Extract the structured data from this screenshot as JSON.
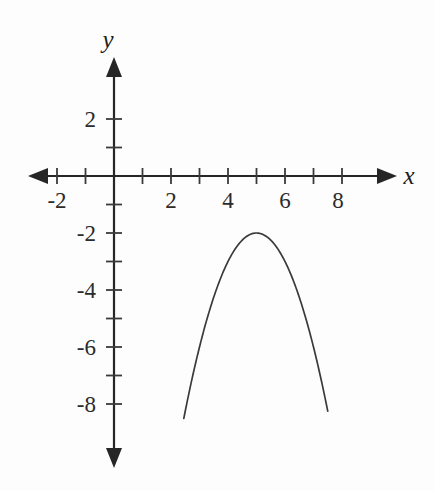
{
  "figure": {
    "background_color": "#fdfdfd",
    "ink_color": "#2b2b2b",
    "axis_label_x": "x",
    "axis_label_y": "y"
  },
  "chart_data": {
    "type": "line",
    "title": "",
    "xlabel": "x",
    "ylabel": "y",
    "grid": false,
    "legend": "none",
    "xlim": [
      -3,
      9.9
    ],
    "ylim": [
      -10.2,
      3.6
    ],
    "x_tick_labels": [
      "-2",
      "2",
      "4",
      "6",
      "8"
    ],
    "x_tick_values": [
      -2,
      2,
      4,
      6,
      8
    ],
    "x_minor_ticks": [
      -2,
      -1,
      1,
      2,
      3,
      4,
      5,
      6,
      7,
      8
    ],
    "y_tick_labels": [
      "2",
      "-2",
      "-4",
      "-6",
      "-8"
    ],
    "y_tick_values": [
      2,
      -2,
      -4,
      -6,
      -8
    ],
    "y_minor_ticks": [
      2,
      1,
      -1,
      -2,
      -3,
      -4,
      -5,
      -6,
      -7,
      -8
    ],
    "series": [
      {
        "name": "parabola",
        "equation": "y = -(x - 5)^2 - 2",
        "vertex": [
          5,
          -2
        ],
        "opens": "down",
        "x_domain": [
          2.45,
          7.5
        ],
        "x": [
          2.45,
          2.7,
          3.0,
          3.3,
          3.6,
          3.9,
          4.2,
          4.5,
          4.8,
          5.0,
          5.2,
          5.5,
          5.8,
          6.1,
          6.4,
          6.7,
          7.0,
          7.3,
          7.5
        ],
        "y": [
          -8.5,
          -7.29,
          -6.0,
          -4.89,
          -3.96,
          -3.21,
          -2.64,
          -2.25,
          -2.04,
          -2.0,
          -2.04,
          -2.25,
          -2.64,
          -3.21,
          -3.96,
          -4.89,
          -6.0,
          -7.29,
          -8.25
        ]
      }
    ]
  }
}
